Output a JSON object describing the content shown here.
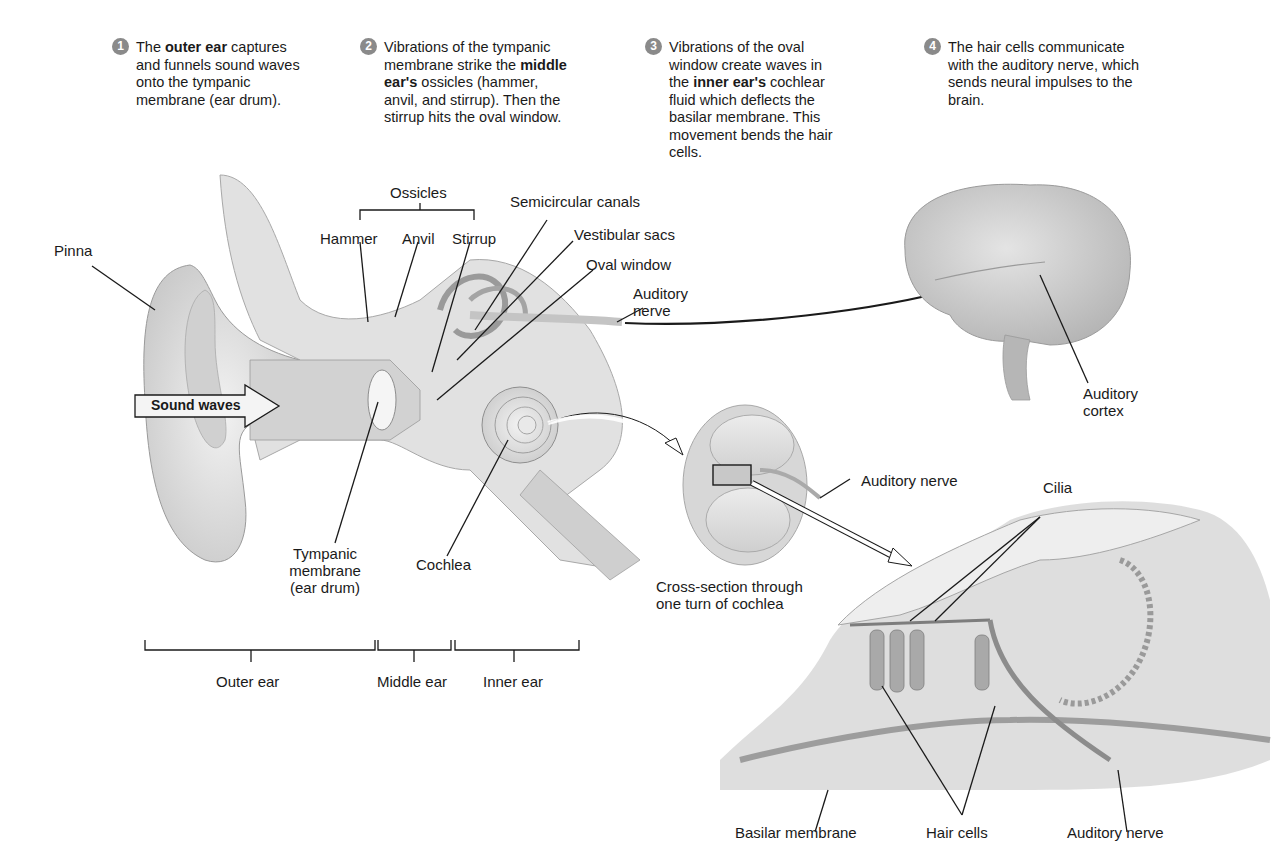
{
  "steps": [
    {
      "number": "1",
      "pre": "The ",
      "bold": "outer ear",
      "post": " captures and funnels sound waves onto the tympanic membrane (ear drum)."
    },
    {
      "number": "2",
      "pre": "Vibrations of the tympanic membrane strike the ",
      "bold": "middle ear's",
      "post": " ossicles (hammer, anvil, and stirrup). Then the stirrup hits the oval window."
    },
    {
      "number": "3",
      "pre": "Vibrations of the oval window create waves in the ",
      "bold": "inner ear's",
      "post": " cochlear fluid which deflects the basilar membrane. This movement bends the hair cells."
    },
    {
      "number": "4",
      "pre": "The hair cells communicate with the auditory nerve, which sends neural impulses to the brain.",
      "bold": "",
      "post": ""
    }
  ],
  "ear_labels": {
    "ossicles": "Ossicles",
    "hammer": "Hammer",
    "anvil": "Anvil",
    "stirrup": "Stirrup",
    "semicircular_canals": "Semicircular canals",
    "vestibular_sacs": "Vestibular sacs",
    "oval_window": "Oval window",
    "auditory_nerve_line1": "Auditory",
    "auditory_nerve_line2": "nerve",
    "pinna": "Pinna",
    "sound_waves": "Sound waves",
    "tympanic_line1": "Tympanic",
    "tympanic_line2": "membrane",
    "tympanic_line3": "(ear drum)",
    "cochlea": "Cochlea"
  },
  "regions": {
    "outer": "Outer ear",
    "middle": "Middle ear",
    "inner": "Inner ear"
  },
  "brain_labels": {
    "cortex_line1": "Auditory",
    "cortex_line2": "cortex"
  },
  "cross_section": {
    "auditory_nerve": "Auditory nerve",
    "caption_line1": "Cross-section through",
    "caption_line2": "one turn of cochlea"
  },
  "organ_of_corti": {
    "cilia": "Cilia",
    "basilar_membrane": "Basilar membrane",
    "hair_cells": "Hair cells",
    "auditory_nerve": "Auditory nerve"
  }
}
